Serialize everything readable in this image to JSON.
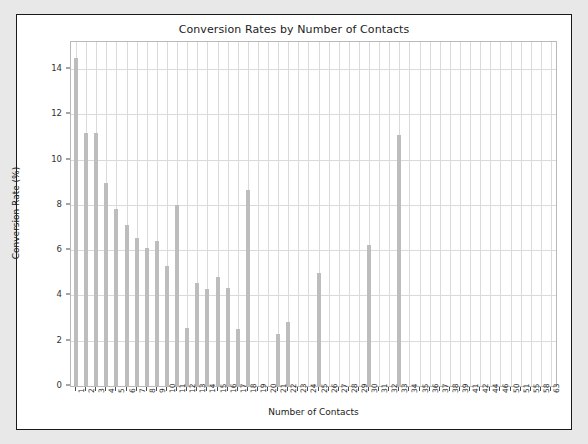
{
  "chart_data": {
    "type": "bar",
    "title": "Conversion Rates by Number of Contacts",
    "xlabel": "Number of Contacts",
    "ylabel": "Conversion Rate (%)",
    "ylim": [
      0,
      15.2
    ],
    "yticks": [
      0,
      2,
      4,
      6,
      8,
      10,
      12,
      14
    ],
    "grid": true,
    "legend": null,
    "bar_color": "#bdbdbd",
    "categories": [
      "1",
      "2",
      "3",
      "4",
      "5",
      "6",
      "7",
      "8",
      "9",
      "10",
      "11",
      "12",
      "13",
      "14",
      "15",
      "16",
      "17",
      "18",
      "19",
      "20",
      "21",
      "22",
      "23",
      "24",
      "25",
      "26",
      "27",
      "28",
      "29",
      "30",
      "31",
      "32",
      "33",
      "34",
      "35",
      "36",
      "37",
      "38",
      "39",
      "41",
      "42",
      "44",
      "46",
      "50",
      "51",
      "55",
      "58",
      "63"
    ],
    "values": [
      14.5,
      11.2,
      11.2,
      8.95,
      7.8,
      7.1,
      6.55,
      6.1,
      6.4,
      5.3,
      8.0,
      2.55,
      4.55,
      4.3,
      4.8,
      4.35,
      2.5,
      8.65,
      0,
      0,
      2.3,
      2.85,
      0,
      0,
      5.0,
      0,
      0,
      0,
      0,
      6.25,
      0,
      0,
      11.1,
      0,
      0,
      0,
      0,
      0,
      0,
      0,
      0,
      0,
      0,
      0,
      0,
      0,
      0,
      0
    ],
    "series_name": "Conversion Rate"
  },
  "figure": {
    "background": "#ffffff",
    "page_background": "#e8e8e8",
    "border_color": "#1a1a1a"
  }
}
